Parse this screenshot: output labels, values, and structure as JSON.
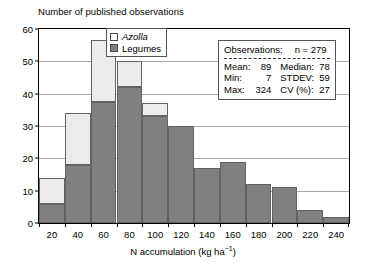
{
  "chart_data": {
    "type": "bar",
    "subtype": "stacked-histogram",
    "title": "Number of published observations",
    "xlabel": "N accumulation (kg ha−1)",
    "ylabel": "",
    "categories": [
      "20",
      "40",
      "60",
      "80",
      "100",
      "120",
      "140",
      "160",
      "180",
      "200",
      "220",
      "240"
    ],
    "series": [
      {
        "name": "Legumes",
        "color": "#808080",
        "values": [
          6,
          18,
          37.5,
          42,
          33,
          30,
          17,
          19,
          12,
          11,
          4,
          2
        ]
      },
      {
        "name": "Azolla",
        "color": "#ececec",
        "values": [
          8,
          16,
          19,
          8,
          4,
          0,
          0,
          0,
          0,
          0,
          0,
          0
        ]
      }
    ],
    "totals": [
      14,
      34,
      56.5,
      50,
      37,
      30,
      17,
      19,
      12,
      11,
      4,
      2
    ],
    "ylim": [
      0,
      60
    ],
    "yticks": [
      0,
      10,
      20,
      30,
      40,
      50,
      60
    ],
    "ytick_labels": [
      "0",
      "10",
      "20",
      "30",
      "40",
      "50",
      "60"
    ],
    "grid": true,
    "legend_position": "top-center"
  },
  "legend": {
    "items": [
      {
        "label": "Azolla",
        "swatch": "white-square",
        "italic": true
      },
      {
        "label": "Legumes",
        "swatch": "gray-square",
        "italic": false
      }
    ]
  },
  "stats_box": {
    "header_key": "Observations:",
    "header_value": "n = 279",
    "rows": [
      {
        "k": "Mean:",
        "v": "89",
        "k2": "Median:",
        "v2": "78"
      },
      {
        "k": "Min:",
        "v": "7",
        "k2": "STDEV:",
        "v2": "59"
      },
      {
        "k": "Max:",
        "v": "324",
        "k2": "CV (%):",
        "v2": "27"
      }
    ]
  },
  "axis_title": {
    "prefix": "N accumulation (kg ha",
    "sup": "−1",
    "suffix": ")"
  },
  "colors": {
    "azolla": "#ececec",
    "legumes": "#808080",
    "grid": "#a8a8a8",
    "frame": "#000000"
  }
}
